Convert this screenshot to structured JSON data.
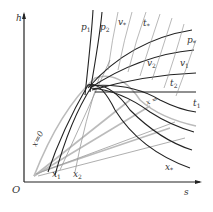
{
  "diagram": {
    "axes": {
      "origin": "O",
      "y": "h",
      "x": "s"
    },
    "curve_labels": {
      "p1": {
        "base": "p",
        "sub": "1"
      },
      "p2": {
        "base": "p",
        "sub": "2"
      },
      "v_top": {
        "base": "v",
        "sub": "*"
      },
      "t_star": {
        "base": "t",
        "sub": "*"
      },
      "p_star": {
        "base": "p",
        "sub": "*"
      },
      "v2": {
        "base": "v",
        "sub": "2"
      },
      "v1": {
        "base": "v",
        "sub": "1"
      },
      "t2": {
        "base": "t",
        "sub": "2"
      },
      "t1": {
        "base": "t",
        "sub": "1"
      },
      "x_right": "x =",
      "x0": "x=0",
      "x1": {
        "base": "x",
        "sub": "1"
      },
      "x2": {
        "base": "x",
        "sub": "2"
      },
      "x_star": {
        "base": "x",
        "sub": "*"
      }
    },
    "colors": {
      "axis": "#222222",
      "dark_curve": "#222222",
      "gray_curve": "#aaaaaa",
      "light_curve": "#cccccc"
    }
  }
}
